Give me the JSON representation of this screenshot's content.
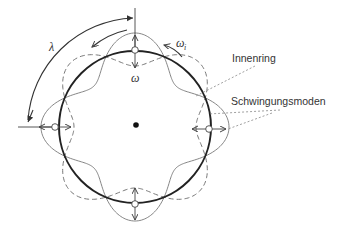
{
  "diagram": {
    "labels": {
      "inner_ring": "Innenring",
      "vibration_modes": "Schwingungsmoden",
      "wavelength": "λ",
      "omega": "ω",
      "omega_i": "ω",
      "omega_i_sub": "i"
    },
    "nodes": 4,
    "mode_lobes": 4,
    "colors": {
      "ring": "#222222",
      "mode_solid": "#666666",
      "mode_dashed": "#666666",
      "leader": "#777777",
      "center_dot": "#111111"
    }
  }
}
